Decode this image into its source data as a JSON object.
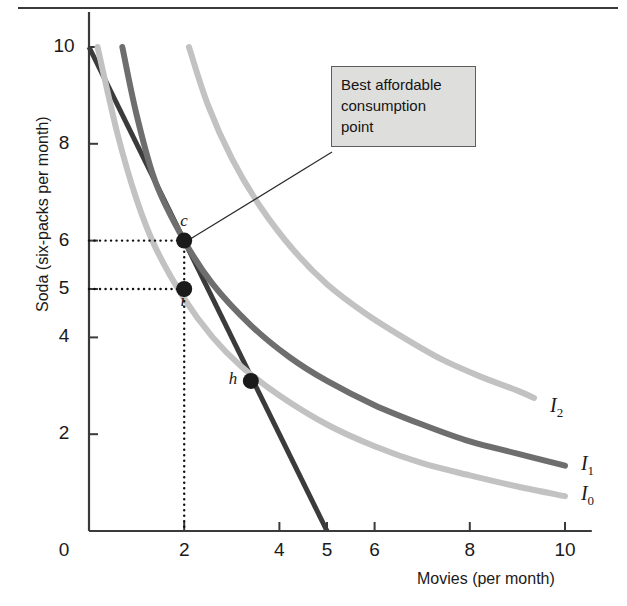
{
  "figure": {
    "top_rule": "horizontal-rule"
  },
  "callout": {
    "lines": [
      "Best affordable",
      "consumption",
      "point"
    ]
  },
  "chart_data": {
    "type": "line",
    "title": "",
    "xlabel": "Movies (per month)",
    "ylabel": "Soda (six-packs per month)",
    "xlim": [
      0,
      10.5
    ],
    "ylim": [
      0,
      10.6
    ],
    "xticks": [
      0,
      2,
      4,
      5,
      6,
      8,
      10
    ],
    "xtick_labels": [
      "0",
      "2",
      "4",
      "5",
      "6",
      "8",
      "10"
    ],
    "yticks": [
      0,
      2,
      4,
      5,
      6,
      8,
      10
    ],
    "ytick_labels": [
      "0",
      "2",
      "4",
      "5",
      "6",
      "8",
      "10"
    ],
    "grid": false,
    "legend_position": "right-of-curve-ends",
    "series": [
      {
        "name": "Budget line",
        "color": "#3b3b3b",
        "width": 5,
        "kind": "straight",
        "points": [
          [
            0,
            10
          ],
          [
            5,
            0
          ]
        ]
      },
      {
        "name": "I0",
        "label": "I",
        "sub": "0",
        "color": "#c2c2c2",
        "width": 6,
        "kind": "indifference",
        "points": [
          [
            0.18,
            10
          ],
          [
            0.6,
            8.2
          ],
          [
            1.0,
            6.85
          ],
          [
            1.4,
            5.85
          ],
          [
            2.0,
            4.8
          ],
          [
            2.6,
            4.0
          ],
          [
            3.2,
            3.4
          ],
          [
            4.0,
            2.8
          ],
          [
            5.0,
            2.2
          ],
          [
            6.0,
            1.75
          ],
          [
            7.0,
            1.4
          ],
          [
            8.0,
            1.15
          ],
          [
            9.0,
            0.92
          ],
          [
            10.0,
            0.72
          ]
        ],
        "label_xy": [
          10.25,
          0.72
        ]
      },
      {
        "name": "I1",
        "label": "I",
        "sub": "1",
        "color": "#6e6e6e",
        "width": 6,
        "kind": "indifference",
        "points": [
          [
            0.7,
            10
          ],
          [
            1.0,
            8.6
          ],
          [
            1.4,
            7.2
          ],
          [
            2.0,
            6.0
          ],
          [
            2.6,
            5.1
          ],
          [
            3.4,
            4.25
          ],
          [
            4.2,
            3.6
          ],
          [
            5.0,
            3.1
          ],
          [
            6.0,
            2.6
          ],
          [
            7.0,
            2.2
          ],
          [
            8.0,
            1.85
          ],
          [
            9.0,
            1.6
          ],
          [
            10.0,
            1.35
          ]
        ],
        "label_xy": [
          10.25,
          1.35
        ]
      },
      {
        "name": "I2",
        "label": "I",
        "sub": "2",
        "color": "#c2c2c2",
        "width": 6,
        "kind": "indifference",
        "points": [
          [
            2.1,
            10
          ],
          [
            2.5,
            8.8
          ],
          [
            3.0,
            7.7
          ],
          [
            3.6,
            6.7
          ],
          [
            4.3,
            5.8
          ],
          [
            5.0,
            5.1
          ],
          [
            5.8,
            4.5
          ],
          [
            6.6,
            4.0
          ],
          [
            7.4,
            3.55
          ],
          [
            8.2,
            3.2
          ],
          [
            9.0,
            2.9
          ],
          [
            9.35,
            2.75
          ]
        ],
        "label_xy": [
          9.6,
          2.55
        ]
      }
    ],
    "points": [
      {
        "name": "c",
        "label": "c",
        "x": 2,
        "y": 6,
        "label_dx": -4,
        "label_dy": -22
      },
      {
        "name": "i",
        "label": "i",
        "x": 2,
        "y": 5,
        "label_dx": -4,
        "label_dy": 10
      },
      {
        "name": "h",
        "label": "h",
        "x": 3.4,
        "y": 3.1,
        "label_dx": -22,
        "label_dy": -4
      }
    ],
    "guides": [
      {
        "name": "soda-6-guide",
        "from": [
          0,
          6
        ],
        "to": [
          2,
          6
        ]
      },
      {
        "name": "soda-5-guide",
        "from": [
          0,
          5
        ],
        "to": [
          2,
          5
        ]
      },
      {
        "name": "movies-2-guide",
        "from": [
          2,
          6
        ],
        "to": [
          2,
          0
        ]
      }
    ],
    "annotations": [
      {
        "name": "best-affordable-callout",
        "text": "Best affordable consumption point",
        "target": [
          2,
          6
        ]
      }
    ]
  }
}
